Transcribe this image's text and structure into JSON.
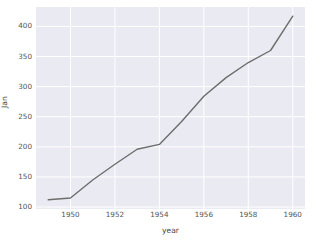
{
  "chart_data": {
    "type": "line",
    "title": "",
    "xlabel": "year",
    "ylabel": "Jan",
    "x": [
      1949,
      1950,
      1951,
      1952,
      1953,
      1954,
      1955,
      1956,
      1957,
      1958,
      1959,
      1960
    ],
    "values": [
      112,
      115,
      145,
      171,
      196,
      204,
      242,
      284,
      315,
      340,
      360,
      417
    ],
    "series": [
      {
        "name": "Jan",
        "values": [
          112,
          115,
          145,
          171,
          196,
          204,
          242,
          284,
          315,
          340,
          360,
          417
        ]
      }
    ],
    "xlim": [
      1948.45,
      1960.55
    ],
    "ylim": [
      96.75,
      432.25
    ],
    "xticks": [
      1950,
      1952,
      1954,
      1956,
      1958,
      1960
    ],
    "xtick_labels": [
      "1950",
      "1952",
      "1954",
      "1956",
      "1958",
      "1960"
    ],
    "yticks": [
      100,
      150,
      200,
      250,
      300,
      350,
      400
    ],
    "ytick_labels": [
      "100",
      "150",
      "200",
      "250",
      "300",
      "350",
      "400"
    ],
    "grid": true,
    "legend": false,
    "legend_position": "none",
    "annotations": [],
    "colors": {
      "line": "#6d6d6d",
      "axes_background": "#eaeaf2",
      "figure_background": "#ffffff",
      "grid": "#ffffff",
      "tick_label": "#555555",
      "axis_label": "#444444"
    },
    "line_width": 1.4
  }
}
